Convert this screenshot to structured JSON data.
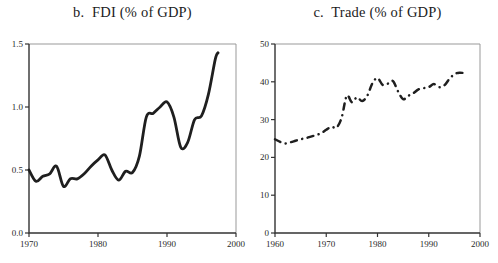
{
  "figure": {
    "background": "#ffffff",
    "ink_color": "#1f1f1f",
    "frame_dark_color": "#333333",
    "frame_light_color": "#999999",
    "tick_text_color": "#2a2a2a"
  },
  "chart_data": [
    {
      "type": "line",
      "title": "b.  FDI (% of GDP)",
      "xlabel": "",
      "ylabel": "",
      "line_style": "solid",
      "line_color": "#1f1f1f",
      "legend": "none",
      "grid": false,
      "xlim": [
        1970,
        2000
      ],
      "ylim": [
        0,
        1.5
      ],
      "xtick_values": [
        1970,
        1980,
        1990,
        2000
      ],
      "xtick_labels": [
        "1970",
        "1980",
        "1990",
        "2000"
      ],
      "ytick_values": [
        0,
        0.5,
        1.0,
        1.5
      ],
      "ytick_labels": [
        "0.0",
        "0.5",
        "1.0",
        "1.5"
      ],
      "x": [
        1970,
        1971,
        1972,
        1973,
        1974,
        1975,
        1976,
        1977,
        1978,
        1979,
        1980,
        1981,
        1982,
        1983,
        1984,
        1985,
        1986,
        1987,
        1988,
        1989,
        1990,
        1991,
        1992,
        1993,
        1994,
        1995,
        1996,
        1997,
        1997.4
      ],
      "y": [
        0.5,
        0.41,
        0.45,
        0.47,
        0.53,
        0.37,
        0.43,
        0.43,
        0.47,
        0.53,
        0.58,
        0.62,
        0.5,
        0.42,
        0.49,
        0.48,
        0.61,
        0.92,
        0.95,
        1.0,
        1.04,
        0.92,
        0.68,
        0.72,
        0.9,
        0.93,
        1.1,
        1.38,
        1.43
      ]
    },
    {
      "type": "line",
      "title": "c.  Trade (% of GDP)",
      "xlabel": "",
      "ylabel": "",
      "line_style": "dash-dot",
      "line_color": "#1f1f1f",
      "legend": "none",
      "grid": false,
      "xlim": [
        1960,
        2000
      ],
      "ylim": [
        0,
        50
      ],
      "xtick_values": [
        1960,
        1970,
        1980,
        1990,
        2000
      ],
      "xtick_labels": [
        "1960",
        "1970",
        "1980",
        "1990",
        "2000"
      ],
      "ytick_values": [
        0,
        10,
        20,
        30,
        40,
        50
      ],
      "ytick_labels": [
        "0",
        "10",
        "20",
        "30",
        "40",
        "50"
      ],
      "x": [
        1960,
        1961,
        1962,
        1963,
        1964,
        1965,
        1966,
        1967,
        1968,
        1969,
        1970,
        1971,
        1972,
        1973,
        1974,
        1975,
        1976,
        1977,
        1978,
        1979,
        1980,
        1981,
        1982,
        1983,
        1984,
        1985,
        1986,
        1987,
        1988,
        1989,
        1990,
        1991,
        1992,
        1993,
        1994,
        1995,
        1996,
        1997.5
      ],
      "y": [
        24.8,
        24.1,
        23.7,
        24.0,
        24.4,
        24.8,
        25.1,
        25.5,
        25.9,
        26.4,
        27.3,
        28.1,
        27.9,
        30.5,
        36.3,
        34.6,
        35.9,
        34.9,
        36.3,
        39.6,
        41.0,
        39.2,
        39.5,
        40.2,
        37.5,
        35.4,
        36.3,
        37.0,
        38.0,
        38.3,
        38.6,
        39.4,
        38.6,
        39.0,
        40.7,
        42.0,
        42.4,
        42.2
      ]
    }
  ]
}
